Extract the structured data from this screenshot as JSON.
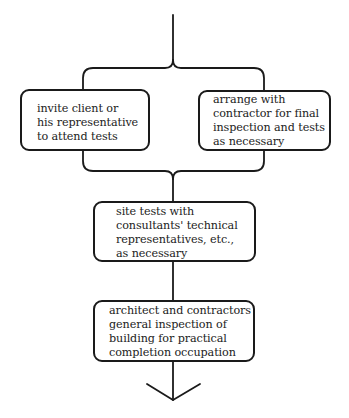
{
  "diagram": {
    "type": "flowchart",
    "colors": {
      "stroke": "#1a1a1a",
      "text": "#222222",
      "background": "#ffffff"
    },
    "nodes": [
      {
        "id": "invite",
        "lines": [
          "invite client or",
          "his representative",
          "to attend tests"
        ]
      },
      {
        "id": "arrange",
        "lines": [
          "arrange with",
          "contractor for final",
          "inspection and tests",
          "as necessary"
        ]
      },
      {
        "id": "site",
        "lines": [
          "site tests with",
          "consultants' technical",
          "representatives, etc.,",
          "as necessary"
        ]
      },
      {
        "id": "architect",
        "lines": [
          "architect and contractors",
          "general inspection of",
          "building for practical",
          "completion occupation"
        ]
      }
    ],
    "edges": [
      {
        "from": "above",
        "to": [
          "invite",
          "arrange"
        ],
        "style": "brace-split"
      },
      {
        "from": [
          "invite",
          "arrange"
        ],
        "to": "site",
        "style": "brace-merge"
      },
      {
        "from": "site",
        "to": "architect",
        "style": "line"
      },
      {
        "from": "architect",
        "to": "below",
        "style": "arrow"
      }
    ]
  }
}
